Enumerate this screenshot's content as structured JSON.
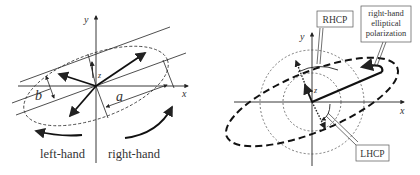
{
  "left_panel": {
    "axis_labels": {
      "x": "x",
      "y": "y",
      "z": "z"
    },
    "semi_major_label": "a",
    "semi_minor_label": "b",
    "rotation_labels": {
      "left": "left-hand",
      "right": "right-hand"
    }
  },
  "right_panel": {
    "axis_labels": {
      "x": "x",
      "y": "y",
      "z": "z"
    },
    "callouts": {
      "rhcp": "RHCP",
      "lhcp": "LHCP",
      "elliptical_line1": "right-hand",
      "elliptical_line2": "elliptical",
      "elliptical_line3": "polarization"
    }
  },
  "colors": {
    "stroke": "#222222",
    "text": "#333333",
    "background": "#ffffff"
  }
}
